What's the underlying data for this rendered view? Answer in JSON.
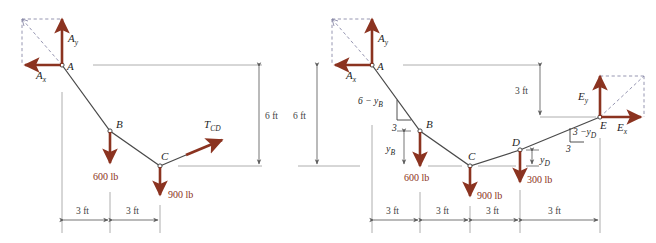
{
  "figure": {
    "colors": {
      "force_arrow": "#8B3320",
      "cable_line": "#4a4a4a",
      "dimension_line": "#6b6b6b",
      "dashed_construction": "#7a7a9a",
      "label_text": "#1f1f1f"
    },
    "left_diagram": {
      "name": "segment-ABC-free-body",
      "points": [
        {
          "id": "A",
          "label": "A"
        },
        {
          "id": "B",
          "label": "B"
        },
        {
          "id": "C",
          "label": "C"
        }
      ],
      "reactions": [
        {
          "id": "Ay",
          "base": "A",
          "sub": "y",
          "direction": "up"
        },
        {
          "id": "Ax",
          "base": "A",
          "sub": "x",
          "direction": "left"
        }
      ],
      "loads": [
        {
          "at": "B",
          "label": "600 lb",
          "direction": "down"
        },
        {
          "at": "C",
          "label": "900 lb",
          "direction": "down"
        }
      ],
      "tension": {
        "base": "T",
        "sub": "CD",
        "at": "C",
        "direction": "up-right"
      },
      "vertical_dims": [
        {
          "label": "6 ft"
        }
      ],
      "horizontal_dims": [
        {
          "label": "3 ft"
        },
        {
          "label": "3 ft"
        }
      ]
    },
    "right_diagram": {
      "name": "full-cable-ABCDE-free-body",
      "points": [
        {
          "id": "A",
          "label": "A"
        },
        {
          "id": "B",
          "label": "B"
        },
        {
          "id": "C",
          "label": "C"
        },
        {
          "id": "D",
          "label": "D"
        },
        {
          "id": "E",
          "label": "E"
        }
      ],
      "reactions": [
        {
          "id": "Ay",
          "base": "A",
          "sub": "y",
          "direction": "up"
        },
        {
          "id": "Ax",
          "base": "A",
          "sub": "x",
          "direction": "left"
        },
        {
          "id": "Ey",
          "base": "E",
          "sub": "y",
          "direction": "up"
        },
        {
          "id": "Ex",
          "base": "E",
          "sub": "x",
          "direction": "right"
        }
      ],
      "loads": [
        {
          "at": "B",
          "label": "600 lb",
          "direction": "down"
        },
        {
          "at": "C",
          "label": "900 lb",
          "direction": "down"
        },
        {
          "at": "D",
          "label": "300 lb",
          "direction": "down"
        }
      ],
      "slope_triangles": [
        {
          "id": "AB",
          "rise_expr": "6",
          "rise_minus": "−",
          "rise_var": "y",
          "rise_sub": "B",
          "run": "3"
        },
        {
          "id": "DE",
          "rise_expr": "3",
          "rise_minus": "−",
          "rise_var": "y",
          "rise_sub": "D",
          "run": "3"
        }
      ],
      "vertical_dims": [
        {
          "label": "6 ft"
        },
        {
          "label": "3 ft"
        },
        {
          "base": "y",
          "sub": "B"
        },
        {
          "base": "y",
          "sub": "D"
        }
      ],
      "horizontal_dims": [
        {
          "label": "3 ft"
        },
        {
          "label": "3 ft"
        },
        {
          "label": "3 ft"
        },
        {
          "label": "3 ft"
        }
      ]
    }
  }
}
